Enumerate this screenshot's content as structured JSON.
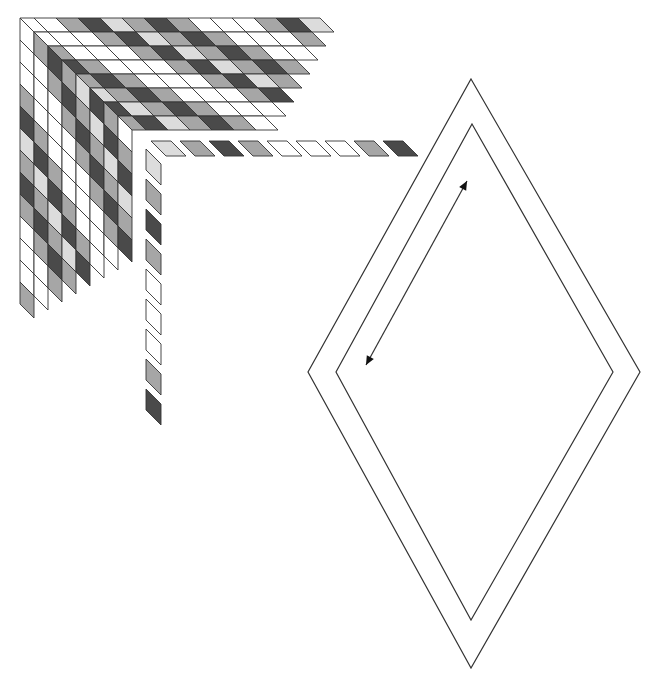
{
  "figure": {
    "width": 661,
    "height": 681,
    "background": "#ffffff",
    "stroke": "#333333"
  },
  "shades": {
    "W": "#ffffff",
    "L": "#dcdcdc",
    "M": "#a6a6a6",
    "D": "#4a4a4a"
  },
  "sequence": [
    "L",
    "M",
    "D",
    "M",
    "W",
    "W",
    "W",
    "M",
    "D"
  ],
  "cube": {
    "origin": [
      20,
      18
    ],
    "layers": 8,
    "layer_step": 14,
    "cell_len": 22,
    "cell_depth": 14,
    "top_cells": 13,
    "left_cells": 13,
    "phase": 6
  },
  "strip_horizontal": {
    "origin": [
      151,
      141
    ],
    "cells": 9,
    "pitch": 29,
    "cell_len": 20,
    "shear": 15,
    "thickness": 15
  },
  "strip_vertical": {
    "origin": [
      146,
      149
    ],
    "cells": 9,
    "pitch": 30,
    "cell_len": 21,
    "shear": 15,
    "thickness": 15
  },
  "diamond": {
    "outer": [
      [
        471,
        79
      ],
      [
        640,
        372
      ],
      [
        471,
        668
      ],
      [
        308,
        372
      ]
    ],
    "inner": [
      [
        472,
        124
      ],
      [
        613,
        372
      ],
      [
        471,
        620
      ],
      [
        336,
        372
      ]
    ]
  },
  "arrow": {
    "from": [
      366,
      365
    ],
    "to": [
      467,
      181
    ],
    "double_headed": true
  }
}
